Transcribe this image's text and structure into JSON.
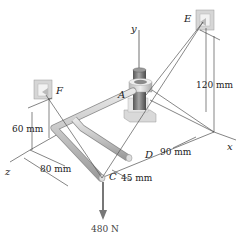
{
  "diagram": {
    "points": {
      "A": "A",
      "C": "C",
      "D": "D",
      "E": "E",
      "F": "F"
    },
    "axes": {
      "x": "x",
      "y": "y",
      "z": "z"
    },
    "dimensions": {
      "d_120": "120 mm",
      "d_60": "60 mm",
      "d_80": "80 mm",
      "d_90": "90 mm",
      "d_45": "45 mm"
    },
    "load": {
      "label": "480 N"
    },
    "colors": {
      "rod": "#c9c9c9",
      "rod_edge": "#8f8f8f",
      "bracket": "#d6d6d6",
      "shaft": "#7d7d7d",
      "cable": "#555555",
      "force_arrow": "#777777"
    }
  }
}
